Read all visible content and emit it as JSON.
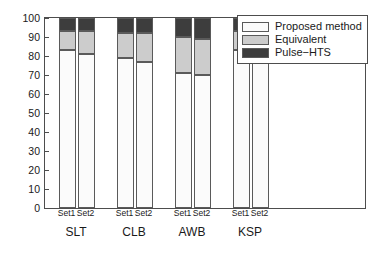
{
  "chart_data": {
    "type": "bar",
    "title": "",
    "xlabel": "",
    "ylabel": "",
    "ylim": [
      0,
      100
    ],
    "ytick_labels": [
      "0",
      "10",
      "20",
      "30",
      "40",
      "50",
      "60",
      "70",
      "80",
      "90",
      "100"
    ],
    "ytick_values": [
      0,
      10,
      20,
      30,
      40,
      50,
      60,
      70,
      80,
      90,
      100
    ],
    "grid": false,
    "stacked": true,
    "stack_total": 100,
    "legend_position": "upper right",
    "groups": [
      "SLT",
      "CLB",
      "AWB",
      "KSP"
    ],
    "subcategories": [
      "Set1",
      "Set2"
    ],
    "categories": [
      "SLT Set1",
      "SLT Set2",
      "CLB Set1",
      "CLB Set2",
      "AWB Set1",
      "AWB Set2",
      "KSP Set1",
      "KSP Set2"
    ],
    "series": [
      {
        "name": "Proposed method",
        "color": "#fbfbfb",
        "values": [
          83,
          81,
          79,
          77,
          71,
          70,
          83,
          80
        ]
      },
      {
        "name": "Equivalent",
        "color": "#cccccc",
        "values": [
          10,
          12,
          13,
          15,
          19,
          19,
          10,
          12
        ]
      },
      {
        "name": "Pulse−HTS",
        "color": "#3d3d3d",
        "values": [
          7,
          7,
          8,
          8,
          10,
          11,
          7,
          8
        ]
      }
    ]
  },
  "legend": {
    "entries": [
      {
        "label": "Proposed method",
        "color": "#fbfbfb"
      },
      {
        "label": "Equivalent",
        "color": "#cccccc"
      },
      {
        "label": "Pulse−HTS",
        "color": "#3d3d3d"
      }
    ]
  },
  "axes": {
    "y": {
      "ticks": [
        {
          "label": "0",
          "value": 0
        },
        {
          "label": "10",
          "value": 10
        },
        {
          "label": "20",
          "value": 20
        },
        {
          "label": "30",
          "value": 30
        },
        {
          "label": "40",
          "value": 40
        },
        {
          "label": "50",
          "value": 50
        },
        {
          "label": "60",
          "value": 60
        },
        {
          "label": "70",
          "value": 70
        },
        {
          "label": "80",
          "value": 80
        },
        {
          "label": "90",
          "value": 90
        },
        {
          "label": "100",
          "value": 100
        }
      ]
    },
    "x": {
      "groups": [
        {
          "label": "SLT",
          "sets": [
            "Set1",
            "Set2"
          ]
        },
        {
          "label": "CLB",
          "sets": [
            "Set1",
            "Set2"
          ]
        },
        {
          "label": "AWB",
          "sets": [
            "Set1",
            "Set2"
          ]
        },
        {
          "label": "KSP",
          "sets": [
            "Set1",
            "Set2"
          ]
        }
      ]
    }
  }
}
